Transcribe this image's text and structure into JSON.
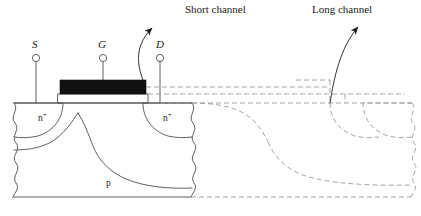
{
  "figure": {
    "type": "cross-section-diagram",
    "width": 421,
    "height": 216,
    "background_color": "#ffffff",
    "solid_line_color": "#4d4d4d",
    "dashed_line_color": "#9a9a9a",
    "gate_fill_color": "#111111"
  },
  "callouts": {
    "short_channel": "Short channel",
    "long_channel": "Long channel"
  },
  "terminals": {
    "source": "S",
    "gate": "G",
    "drain": "D"
  },
  "regions": {
    "source_diffusion": "n",
    "source_diffusion_sup": "+",
    "drain_diffusion": "n",
    "drain_diffusion_sup": "+",
    "substrate": "p"
  }
}
